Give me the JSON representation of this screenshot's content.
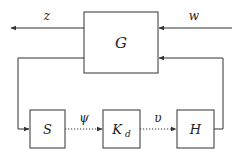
{
  "diagram": {
    "title": "",
    "colors": {
      "line": "#333333",
      "background": "#ffffff"
    },
    "blocks": [
      {
        "id": "G",
        "label": "G"
      },
      {
        "id": "S",
        "label": "S"
      },
      {
        "id": "Kd",
        "label": "K",
        "subscript": "d"
      },
      {
        "id": "H",
        "label": "H"
      }
    ],
    "signals": {
      "z": "z",
      "w": "w",
      "psi": "ψ",
      "upsilon": "υ"
    },
    "edges": [
      {
        "from": "G",
        "to": "out",
        "label": "z",
        "style": "solid"
      },
      {
        "from": "in",
        "to": "G",
        "label": "w",
        "style": "solid"
      },
      {
        "from": "G",
        "to": "S",
        "label": "",
        "style": "solid"
      },
      {
        "from": "S",
        "to": "Kd",
        "label": "ψ",
        "style": "dotted"
      },
      {
        "from": "Kd",
        "to": "H",
        "label": "υ",
        "style": "dotted"
      },
      {
        "from": "H",
        "to": "G",
        "label": "",
        "style": "solid"
      }
    ]
  }
}
